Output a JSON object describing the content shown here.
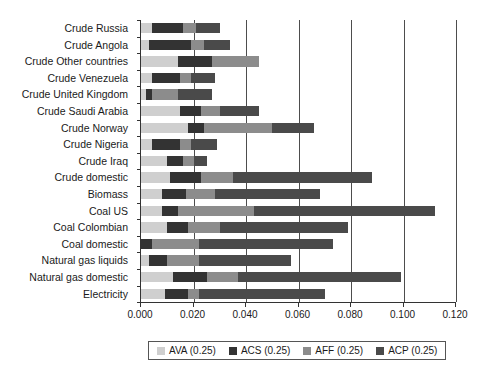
{
  "chart_data": {
    "type": "bar",
    "orientation": "horizontal",
    "stacked": true,
    "title": "",
    "xlabel": "",
    "ylabel": "",
    "xlim": [
      0.0,
      0.12
    ],
    "xticks": [
      "0.000",
      "0.020",
      "0.040",
      "0.060",
      "0.080",
      "0.100",
      "0.120"
    ],
    "xtick_values": [
      0.0,
      0.02,
      0.04,
      0.06,
      0.08,
      0.1,
      0.12
    ],
    "grid": "vertical",
    "legend_position": "bottom",
    "categories": [
      "Crude Russia",
      "Crude Angola",
      "Crude Other countries",
      "Crude Venezuela",
      "Crude United Kingdom",
      "Crude Saudi Arabia",
      "Crude Norway",
      "Crude Nigeria",
      "Crude Iraq",
      "Crude domestic",
      "Biomass",
      "Coal US",
      "Coal Colombian",
      "Coal domestic",
      "Natural gas liquids",
      "Natural gas domestic",
      "Electricity"
    ],
    "series": [
      {
        "name": "AVA (0.25)",
        "color": "#cfcfcf",
        "values": [
          0.004,
          0.003,
          0.014,
          0.004,
          0.002,
          0.015,
          0.018,
          0.004,
          0.01,
          0.011,
          0.008,
          0.008,
          0.01,
          0.0,
          0.003,
          0.012,
          0.009
        ]
      },
      {
        "name": "ACS (0.25)",
        "color": "#333333",
        "values": [
          0.012,
          0.016,
          0.013,
          0.011,
          0.002,
          0.008,
          0.006,
          0.011,
          0.006,
          0.012,
          0.009,
          0.006,
          0.008,
          0.004,
          0.007,
          0.013,
          0.009
        ]
      },
      {
        "name": "AFF (0.25)",
        "color": "#8c8c8c",
        "values": [
          0.005,
          0.005,
          0.018,
          0.004,
          0.01,
          0.007,
          0.026,
          0.004,
          0.004,
          0.012,
          0.011,
          0.029,
          0.012,
          0.018,
          0.012,
          0.012,
          0.004
        ]
      },
      {
        "name": "ACP (0.25)",
        "color": "#4a4a4a",
        "values": [
          0.009,
          0.01,
          0.0,
          0.009,
          0.013,
          0.015,
          0.016,
          0.01,
          0.005,
          0.053,
          0.04,
          0.069,
          0.049,
          0.051,
          0.035,
          0.062,
          0.048
        ]
      }
    ],
    "totals": [
      0.03,
      0.034,
      0.045,
      0.028,
      0.027,
      0.045,
      0.066,
      0.029,
      0.025,
      0.088,
      0.068,
      0.112,
      0.079,
      0.073,
      0.057,
      0.099,
      0.07
    ]
  },
  "legend": {
    "items": [
      {
        "label": "AVA (0.25)",
        "color": "#cfcfcf"
      },
      {
        "label": "ACS (0.25)",
        "color": "#333333"
      },
      {
        "label": "AFF (0.25)",
        "color": "#8c8c8c"
      },
      {
        "label": "ACP (0.25)",
        "color": "#4a4a4a"
      }
    ]
  }
}
